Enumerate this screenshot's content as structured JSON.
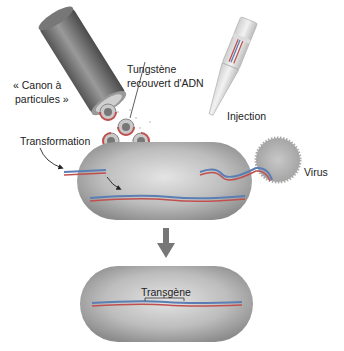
{
  "diagram": {
    "type": "gene-transfer-methods",
    "labels": {
      "gene_gun_line1": "« Canon à",
      "gene_gun_line2": "particules »",
      "tungsten_line1": "Tungstène",
      "tungsten_line2": "recouvert d'ADN",
      "injection": "Injection",
      "transformation": "Transformation",
      "virus": "Virus",
      "transgene": "Transgène"
    },
    "colors": {
      "cell_gray": "#9a9a9a",
      "dna_red": "#c0504d",
      "dna_blue": "#5b7fb5",
      "arrow_gray": "#777777"
    }
  }
}
